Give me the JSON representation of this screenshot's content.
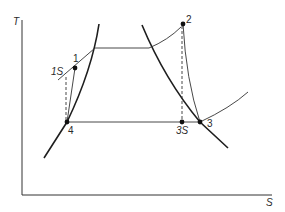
{
  "diagram": {
    "type": "T-S diagram",
    "axes": {
      "y_label": "T",
      "x_label": "S"
    },
    "points": [
      {
        "id": "1",
        "label": "1"
      },
      {
        "id": "1S",
        "label": "1S"
      },
      {
        "id": "2",
        "label": "2"
      },
      {
        "id": "3",
        "label": "3"
      },
      {
        "id": "3S",
        "label": "3S"
      },
      {
        "id": "4",
        "label": "4"
      }
    ],
    "colors": {
      "line": "#1e1e1e",
      "background": "#ffffff"
    }
  }
}
